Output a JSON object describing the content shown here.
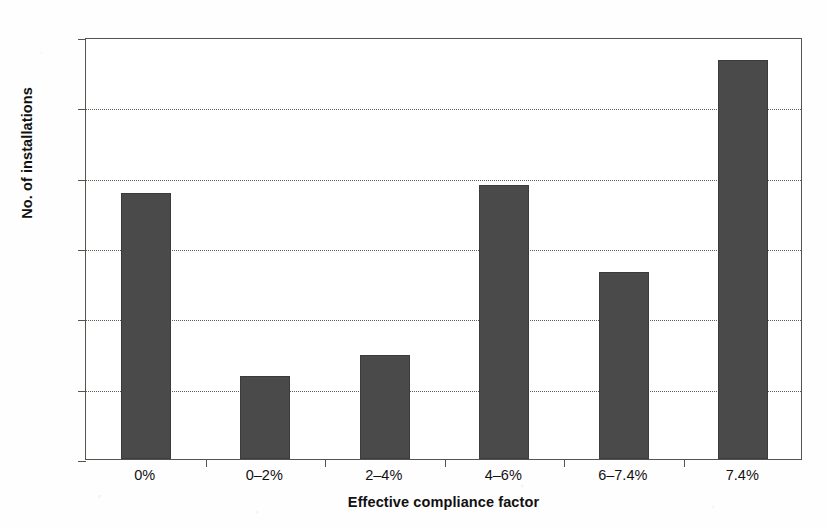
{
  "chart_data": {
    "type": "bar",
    "title": "",
    "xlabel": "Effective compliance factor",
    "ylabel": "No. of installations",
    "categories": [
      "0%",
      "0–2%",
      "2–4%",
      "4–6%",
      "6–7.4%",
      "7.4%"
    ],
    "values": [
      378,
      118,
      148,
      390,
      266,
      568
    ],
    "ylim": [
      0,
      600
    ],
    "yticks": [
      0,
      100,
      200,
      300,
      400,
      500,
      600
    ],
    "ytick_labels": [
      "0",
      "100",
      "200",
      "300",
      "400",
      "500",
      "600"
    ],
    "grid": "horizontal-dotted",
    "legend": "none",
    "bar_color": "#4a4a4a",
    "axis_color": "#55544f",
    "background_color": "#ffffff"
  }
}
